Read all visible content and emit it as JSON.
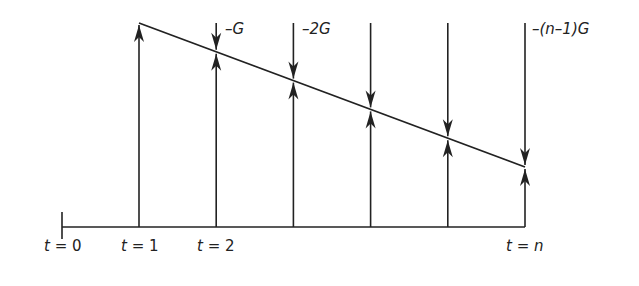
{
  "diagram": {
    "time_labels": [
      {
        "t": "t",
        "eq": "=",
        "val": "0"
      },
      {
        "t": "t",
        "eq": "=",
        "val": "1"
      },
      {
        "t": "t",
        "eq": "=",
        "val": "2"
      },
      {
        "t": "t",
        "eq": "=",
        "val": "n"
      }
    ],
    "gradient_labels": [
      "–G",
      "–2G",
      "–(n–1)G"
    ],
    "periods": 6,
    "line_color": "#222222"
  }
}
